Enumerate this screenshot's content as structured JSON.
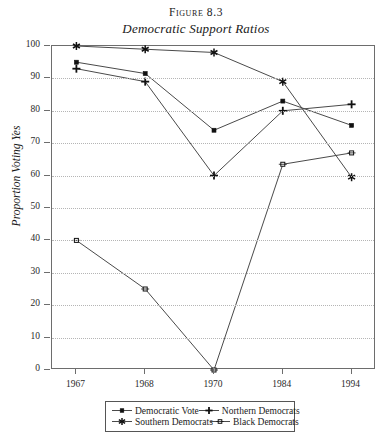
{
  "figure": {
    "number_label": "Figure 8.3",
    "title": "Democratic Support Ratios"
  },
  "chart_data": {
    "type": "line",
    "title": "Democratic Support Ratios",
    "subtitle": "Figure 8.3",
    "xlabel": "",
    "ylabel": "Proportion Voting Yes",
    "categories": [
      "1967",
      "1968",
      "1970",
      "1984",
      "1994"
    ],
    "ylim": [
      0,
      100
    ],
    "xlim_note": "categorical, evenly spaced",
    "yticks": [
      0,
      10,
      20,
      30,
      40,
      50,
      60,
      70,
      80,
      90,
      100
    ],
    "ytick_labels": [
      "0",
      "10",
      "20",
      "30",
      "40",
      "50",
      "60",
      "70",
      "80",
      "90",
      "100"
    ],
    "grid": "horizontal dotted gridlines",
    "legend_position": "below plot, centered, boxed",
    "series": [
      {
        "name": "Democratic Vote",
        "marker": "filled-square",
        "values": [
          95,
          91.5,
          74,
          83,
          75.5
        ]
      },
      {
        "name": "Northern Democrats",
        "marker": "plus",
        "values": [
          93,
          89,
          60,
          80,
          82
        ]
      },
      {
        "name": "Southern Democrats",
        "marker": "asterisk",
        "values": [
          100,
          99,
          98,
          89,
          59.5
        ]
      },
      {
        "name": "Black Democrats",
        "marker": "open-square",
        "values": [
          40,
          25,
          0,
          63.5,
          67
        ]
      }
    ]
  },
  "legend": {
    "entries": [
      {
        "label": "Democratic Vote",
        "marker": "filled-square"
      },
      {
        "label": "Northern Democrats",
        "marker": "plus"
      },
      {
        "label": "Southern Democrats",
        "marker": "asterisk"
      },
      {
        "label": "Black Democrats",
        "marker": "open-square"
      }
    ]
  },
  "axis": {
    "y_title": "Proportion Voting Yes"
  },
  "colors": {
    "line": "#4a4a4a",
    "marker": "#111111",
    "grid": "#b5b5b5",
    "frame": "#6d6d6d",
    "text": "#1a1a1a"
  }
}
